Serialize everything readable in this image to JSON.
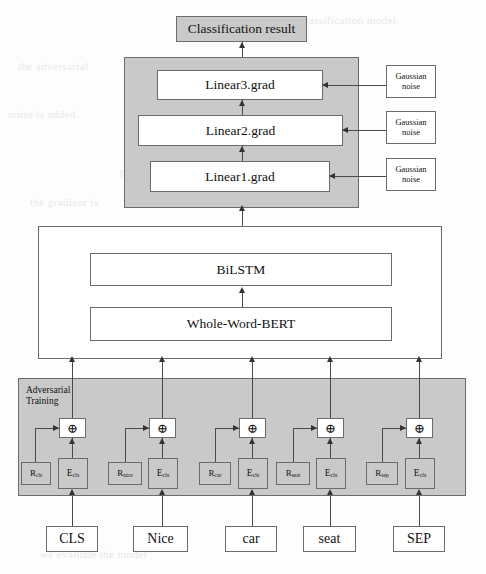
{
  "diagram": {
    "colors": {
      "panel_gray": "#c9c9c9",
      "node_white": "#ffffff",
      "stroke": "#6b6b6b",
      "arrow": "#333333"
    },
    "output": {
      "label": "Classification result"
    },
    "gradient_panel": {
      "layers": [
        {
          "id": "linear3",
          "label": "Linear3.grad"
        },
        {
          "id": "linear2",
          "label": "Linear2.grad"
        },
        {
          "id": "linear1",
          "label": "Linear1.grad"
        }
      ],
      "noise_sources": [
        {
          "id": "noise3",
          "label": "Gaussian\nnoise"
        },
        {
          "id": "noise2",
          "label": "Gaussian\nnoise"
        },
        {
          "id": "noise1",
          "label": "Gaussian\nnoise"
        }
      ]
    },
    "encoder_panel": {
      "layers": [
        {
          "id": "bilstm",
          "label": "BiLSTM"
        },
        {
          "id": "bert",
          "label": "Whole-Word-BERT"
        }
      ]
    },
    "adversarial_panel": {
      "label": "Adversarial\nTraining",
      "operator_symbol": "⊕",
      "columns": [
        {
          "token": "CLS",
          "perturbation": {
            "base": "R",
            "sub": "cls"
          },
          "embedding": {
            "base": "E",
            "sub": "cls"
          }
        },
        {
          "token": "Nice",
          "perturbation": {
            "base": "R",
            "sub": "nice"
          },
          "embedding": {
            "base": "E",
            "sub": "cls"
          }
        },
        {
          "token": "car",
          "perturbation": {
            "base": "R",
            "sub": "car"
          },
          "embedding": {
            "base": "E",
            "sub": "cls"
          }
        },
        {
          "token": "seat",
          "perturbation": {
            "base": "R",
            "sub": "seat"
          },
          "embedding": {
            "base": "E",
            "sub": "cls"
          }
        },
        {
          "token": "SEP",
          "perturbation": {
            "base": "R",
            "sub": "sep"
          },
          "embedding": {
            "base": "E",
            "sub": "cls"
          }
        }
      ]
    },
    "background_bleed": [
      {
        "text": "classification model",
        "x": 300,
        "y": 14
      },
      {
        "text": "the adversarial",
        "x": 18,
        "y": 60
      },
      {
        "text": "noise is added",
        "x": 8,
        "y": 108
      },
      {
        "text": "training of the model can be",
        "x": 160,
        "y": 120
      },
      {
        "text": "perturbation of the embedding layer",
        "x": 120,
        "y": 165
      },
      {
        "text": "the gradient is",
        "x": 30,
        "y": 196
      },
      {
        "text": "robustness of the classifier",
        "x": 150,
        "y": 262
      },
      {
        "text": "semantic representation",
        "x": 120,
        "y": 330
      },
      {
        "text": "experiments show that",
        "x": 240,
        "y": 392
      },
      {
        "text": "in the following section",
        "x": 220,
        "y": 412
      },
      {
        "text": "we evaluate the model",
        "x": 40,
        "y": 548
      }
    ]
  }
}
